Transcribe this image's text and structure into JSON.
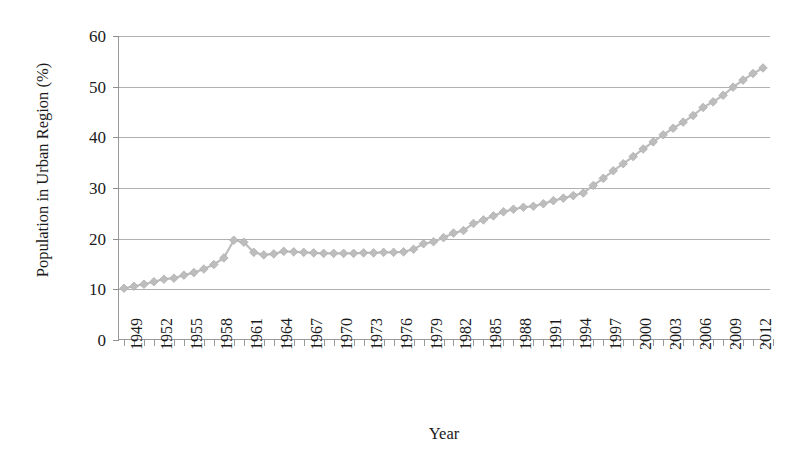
{
  "chart_data": {
    "type": "line",
    "title": "",
    "xlabel": "Year",
    "ylabel": "Population in Urban Region (%)",
    "xlim": [
      1948.5,
      2013.8
    ],
    "ylim": [
      0,
      60
    ],
    "ytick_labels": [
      "0",
      "10",
      "20",
      "30",
      "40",
      "50",
      "60"
    ],
    "ytick_values": [
      0,
      10,
      20,
      30,
      40,
      50,
      60
    ],
    "xtick_labels": [
      "1949",
      "1952",
      "1955",
      "1958",
      "1961",
      "1964",
      "1967",
      "1970",
      "1973",
      "1976",
      "1979",
      "1982",
      "1985",
      "1988",
      "1991",
      "1994",
      "1997",
      "2000",
      "2003",
      "2006",
      "2009",
      "2012"
    ],
    "xtick_values": [
      1949,
      1952,
      1955,
      1958,
      1961,
      1964,
      1967,
      1970,
      1973,
      1976,
      1979,
      1982,
      1985,
      1988,
      1991,
      1994,
      1997,
      2000,
      2003,
      2006,
      2009,
      2012
    ],
    "grid": "horizontal",
    "legend": "none",
    "marker": "diamond",
    "series_color": "#bdbdbd",
    "axis_color": "#9a9a9a",
    "text_color": "#1b1b1b",
    "x": [
      1949,
      1950,
      1951,
      1952,
      1953,
      1954,
      1955,
      1956,
      1957,
      1958,
      1959,
      1960,
      1961,
      1962,
      1963,
      1964,
      1965,
      1966,
      1967,
      1968,
      1969,
      1970,
      1971,
      1972,
      1973,
      1974,
      1975,
      1976,
      1977,
      1978,
      1979,
      1980,
      1981,
      1982,
      1983,
      1984,
      1985,
      1986,
      1987,
      1988,
      1989,
      1990,
      1991,
      1992,
      1993,
      1994,
      1995,
      1996,
      1997,
      1998,
      1999,
      2000,
      2001,
      2002,
      2003,
      2004,
      2005,
      2006,
      2007,
      2008,
      2009,
      2010,
      2011,
      2012,
      2013
    ],
    "values": [
      10.2,
      10.6,
      11.0,
      11.5,
      12.0,
      12.2,
      12.8,
      13.3,
      14.0,
      14.9,
      16.2,
      19.7,
      19.3,
      17.3,
      16.8,
      17.0,
      17.5,
      17.4,
      17.3,
      17.2,
      17.1,
      17.1,
      17.1,
      17.1,
      17.2,
      17.2,
      17.3,
      17.3,
      17.4,
      17.9,
      19.0,
      19.4,
      20.2,
      21.1,
      21.6,
      23.0,
      23.7,
      24.5,
      25.3,
      25.8,
      26.2,
      26.4,
      26.9,
      27.5,
      28.0,
      28.5,
      29.0,
      30.5,
      31.9,
      33.4,
      34.8,
      36.2,
      37.7,
      39.1,
      40.5,
      41.8,
      43.0,
      44.3,
      45.9,
      47.0,
      48.3,
      49.9,
      51.3,
      52.6,
      53.7
    ]
  }
}
